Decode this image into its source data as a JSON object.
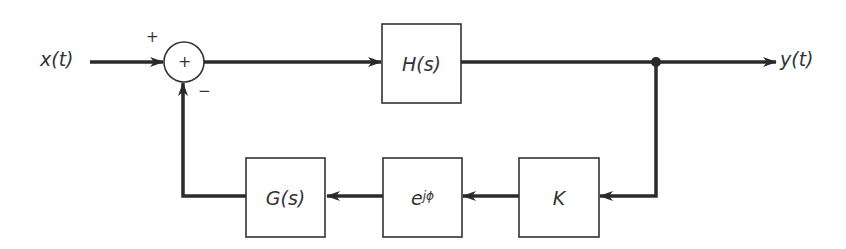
{
  "diagram": {
    "type": "feedback-block-diagram",
    "input": {
      "label": "x(t)"
    },
    "output": {
      "label": "y(t)"
    },
    "summing_junction": {
      "symbol": "+",
      "input_signs": {
        "top": "+",
        "bottom": "−"
      }
    },
    "blocks": {
      "forward": {
        "label": "H(s)"
      },
      "feedback_gain": {
        "label": "K"
      },
      "phase_shift": {
        "base": "e",
        "exponent": "jϕ"
      },
      "feedback_filter": {
        "label": "G(s)"
      }
    },
    "colors": {
      "line": "#2a2a2a",
      "box": "#333333",
      "text": "#333333",
      "background": "#ffffff"
    }
  }
}
